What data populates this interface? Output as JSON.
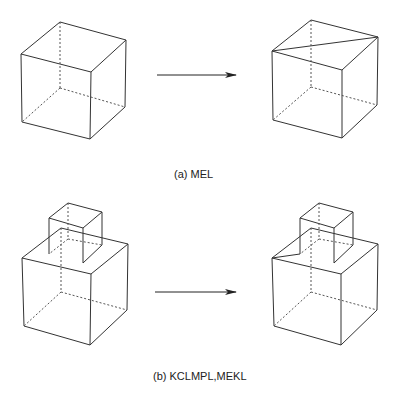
{
  "figure": {
    "panels": [
      {
        "id": "a",
        "caption": "(a) MEL",
        "before": "cube",
        "after": "cube with top-face diagonal edge",
        "transition": "arrow-right"
      },
      {
        "id": "b",
        "caption": "(b)  KCLMPL,MEKL",
        "before": "small cube stacked on large cube",
        "after": "small cube on large cube with edge added on large cube top face",
        "transition": "arrow-right"
      }
    ],
    "colors": {
      "line": "#333333",
      "background": "#ffffff"
    }
  }
}
